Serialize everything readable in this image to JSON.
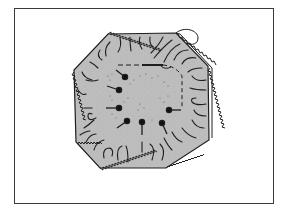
{
  "figure": {
    "colors": {
      "background": "#ffffff",
      "frame": "#3a3a3a",
      "fabric": "#bdbdbd",
      "ink": "#1e1e1e"
    },
    "octagon_points": "108,34 176,33 208,66 209,140 166,168 100,168 76,142 74,70",
    "pins": [
      {
        "name": "pin-1",
        "head": [
          125,
          77
        ],
        "tail": [
          117,
          70
        ]
      },
      {
        "name": "pin-2",
        "head": [
          119,
          90
        ],
        "tail": [
          108,
          87
        ]
      },
      {
        "name": "pin-3",
        "head": [
          119,
          108
        ],
        "tail": [
          106,
          108
        ]
      },
      {
        "name": "pin-4",
        "head": [
          127,
          121
        ],
        "tail": [
          118,
          128
        ]
      },
      {
        "name": "pin-5",
        "head": [
          142,
          122
        ],
        "tail": [
          142,
          134
        ]
      },
      {
        "name": "pin-6",
        "head": [
          162,
          123
        ],
        "tail": [
          166,
          133
        ]
      },
      {
        "name": "pin-7",
        "head": [
          169,
          110
        ],
        "tail": [
          180,
          110
        ]
      }
    ]
  }
}
